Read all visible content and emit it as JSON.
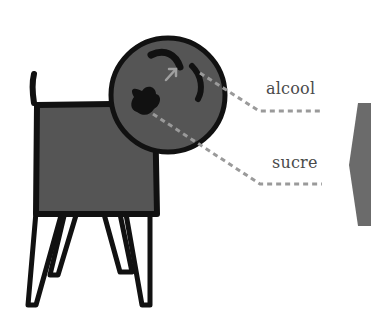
{
  "labels": {
    "alcohol": "alcool",
    "sugar": "sucre"
  },
  "colors": {
    "fill": "#555555",
    "outline": "#111111",
    "dash": "#9a9a9a",
    "hexagon": "#6b6b6b",
    "text": "#4a4a4a"
  }
}
